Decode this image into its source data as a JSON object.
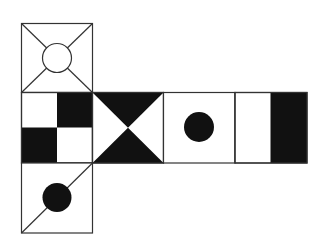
{
  "diagram": {
    "type": "cube-net",
    "stroke_color": "#333333",
    "fill_color": "#111111",
    "background": "#ffffff",
    "faces": [
      {
        "id": "top",
        "pattern": "X-diagonals with hollow circle center"
      },
      {
        "id": "left",
        "pattern": "2x2 checkerboard (top-right and bottom-left black)"
      },
      {
        "id": "front",
        "pattern": "hourglass (top and bottom black triangles)"
      },
      {
        "id": "right",
        "pattern": "black dot center"
      },
      {
        "id": "back",
        "pattern": "vertical stripe, right third black"
      },
      {
        "id": "bottom",
        "pattern": "diagonal line with black dot center"
      }
    ]
  }
}
